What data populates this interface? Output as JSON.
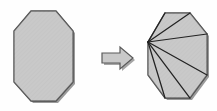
{
  "figure": {
    "canvas": {
      "width": 217,
      "height": 111,
      "background": "#fefefe"
    },
    "colors": {
      "polygon_fill": "#c9c9c9",
      "polygon_stroke": "#4a4a4a",
      "diagonal_stroke": "#222222",
      "shadow": "#9a9a9a",
      "arrow_fill": "#c9c9c9",
      "arrow_stroke": "#5a5a5a",
      "arrow_shadow": "#a6a6a6"
    },
    "shapes": {
      "left_polygon": {
        "name": "simple-octagon",
        "sides": 8,
        "label": "",
        "vertices": [
          [
            31,
            11
          ],
          [
            56,
            11
          ],
          [
            73,
            31
          ],
          [
            73,
            82
          ],
          [
            56,
            101
          ],
          [
            31,
            101
          ],
          [
            14,
            82
          ],
          [
            14,
            31
          ]
        ],
        "shadow_offset": [
          2,
          2
        ]
      },
      "arrow": {
        "name": "transformation-arrow",
        "direction": "right",
        "label": "",
        "points": [
          [
            102,
            53
          ],
          [
            120,
            53
          ],
          [
            120,
            47
          ],
          [
            133,
            58
          ],
          [
            120,
            69
          ],
          [
            120,
            63
          ],
          [
            102,
            63
          ]
        ],
        "shadow_offset": [
          2,
          2
        ]
      },
      "right_polygon": {
        "name": "triangulated-octagon",
        "sides": 8,
        "label": "",
        "vertices": [
          [
            165,
            13
          ],
          [
            190,
            13
          ],
          [
            207,
            34
          ],
          [
            207,
            75
          ],
          [
            190,
            98
          ],
          [
            165,
            98
          ],
          [
            148,
            75
          ],
          [
            148,
            42
          ]
        ],
        "fan_apex_index": 7,
        "fan_apex": [
          148,
          42
        ],
        "diagonals": [
          [
            [
              148,
              42
            ],
            [
              165,
              13
            ]
          ],
          [
            [
              148,
              42
            ],
            [
              190,
              13
            ]
          ],
          [
            [
              148,
              42
            ],
            [
              207,
              34
            ]
          ],
          [
            [
              148,
              42
            ],
            [
              207,
              75
            ]
          ],
          [
            [
              148,
              42
            ],
            [
              190,
              98
            ]
          ],
          [
            [
              148,
              42
            ],
            [
              165,
              98
            ]
          ]
        ],
        "triangle_count": 6,
        "shadow_offset": [
          2,
          2
        ]
      }
    }
  }
}
